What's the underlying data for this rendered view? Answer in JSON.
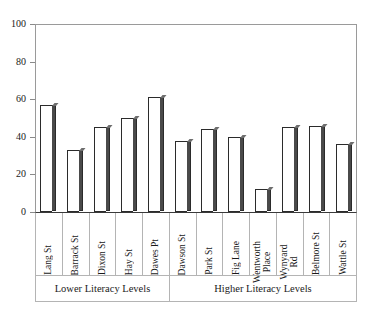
{
  "chart_data": {
    "type": "bar",
    "title": "",
    "xlabel": "",
    "ylabel": "",
    "ylim": [
      0,
      100
    ],
    "ytick_step": 20,
    "yticks": [
      0,
      20,
      40,
      60,
      80,
      100
    ],
    "ytick_labels": [
      "0",
      "20",
      "40",
      "60",
      "80",
      "100"
    ],
    "grid": false,
    "legend": false,
    "bar_style": {
      "fill": "#ffffff",
      "edge": "#2b2b2b",
      "side_shade": "#4a4a4a"
    },
    "categories": [
      "Lang St",
      "Barrack St",
      "Dixon St",
      "Hay St",
      "Dawes Pt",
      "Dawson St",
      "Park St",
      "Fig Lane",
      "Wentworth Place",
      "Wynyard Rd",
      "Belmore St",
      "Wattle St"
    ],
    "category_labels": [
      {
        "text": "Lang St",
        "lines": [
          "Lang St"
        ]
      },
      {
        "text": "Barrack St",
        "lines": [
          "Barrack St"
        ]
      },
      {
        "text": "Dixon St",
        "lines": [
          "Dixon St"
        ]
      },
      {
        "text": "Hay St",
        "lines": [
          "Hay St"
        ]
      },
      {
        "text": "Dawes Pt",
        "lines": [
          "Dawes Pt"
        ]
      },
      {
        "text": "Dawson St",
        "lines": [
          "Dawson St"
        ]
      },
      {
        "text": "Park St",
        "lines": [
          "Park St"
        ]
      },
      {
        "text": "Fig Lane",
        "lines": [
          "Fig Lane"
        ]
      },
      {
        "text": "Wentworth Place",
        "lines": [
          "Wentworth",
          "Place"
        ]
      },
      {
        "text": "Wynyard Rd",
        "lines": [
          "Wynyard",
          "Rd"
        ]
      },
      {
        "text": "Belmore St",
        "lines": [
          "Belmore St"
        ]
      },
      {
        "text": "Wattle St",
        "lines": [
          "Wattle St"
        ]
      }
    ],
    "values": [
      57,
      33,
      45,
      50,
      61,
      38,
      44,
      40,
      12,
      45,
      46,
      36
    ],
    "groups": [
      {
        "label": "Lower Literacy Levels",
        "span": 5
      },
      {
        "label": "Higher Literacy Levels",
        "span": 7
      }
    ]
  }
}
